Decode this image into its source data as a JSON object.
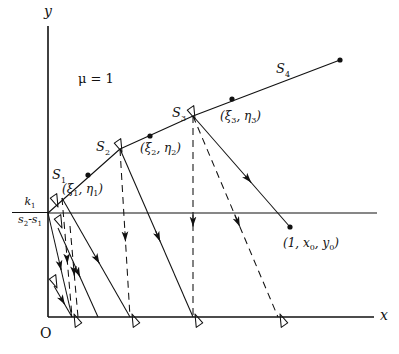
{
  "figure": {
    "background_color": "#ffffff",
    "ink_color": "#111111",
    "width": 399,
    "height": 354
  },
  "axes": {
    "y_label": "y",
    "x_label": "x",
    "origin_label": "O",
    "y_axis": {
      "x": 48,
      "y_top": 26,
      "y_bottom": 317
    },
    "x_axis": {
      "y": 317,
      "x_left": 48,
      "x_right": 374
    },
    "horizontal_line": {
      "y": 213,
      "x_left": 48,
      "x_right": 377
    }
  },
  "annotations": {
    "mu_label": "μ = 1",
    "axis_ratio_numerator": "k",
    "axis_ratio_numerator_sub": "1",
    "axis_ratio_denominator_a": "s",
    "axis_ratio_denominator_a_sub": "2",
    "axis_ratio_denominator_minus": "-",
    "axis_ratio_denominator_b": "s",
    "axis_ratio_denominator_b_sub": "1",
    "endpoint_label": "(1, x₀, y₀)"
  },
  "curve": {
    "name": "upper-characteristic-polyline",
    "points": [
      {
        "x": 48,
        "y": 213
      },
      {
        "x": 120,
        "y": 149
      },
      {
        "x": 193,
        "y": 116
      },
      {
        "x": 340,
        "y": 60
      }
    ]
  },
  "segment_labels": [
    {
      "id": "S1",
      "text": "S",
      "sub": "1",
      "x": 52,
      "y": 168
    },
    {
      "id": "S2",
      "text": "S",
      "sub": "2",
      "x": 96,
      "y": 140
    },
    {
      "id": "S3",
      "text": "S",
      "sub": "3",
      "x": 172,
      "y": 106
    },
    {
      "id": "S4",
      "text": "S",
      "sub": "4",
      "x": 276,
      "y": 62
    }
  ],
  "node_points": [
    {
      "id": "xi1",
      "cx": 88,
      "cy": 175,
      "label": "(ξ",
      "sub1": "1",
      "mid": ", η",
      "sub2": "1",
      "tail": ")",
      "lx": 62,
      "ly": 183
    },
    {
      "id": "xi2",
      "cx": 150,
      "cy": 136,
      "label": "(ξ",
      "sub1": "2",
      "mid": ", η",
      "sub2": "2",
      "tail": ")",
      "lx": 140,
      "ly": 142
    },
    {
      "id": "xi3",
      "cx": 232,
      "cy": 99,
      "label": "(ξ",
      "sub1": "3",
      "mid": ", η",
      "sub2": "3",
      "tail": ")",
      "lx": 220,
      "ly": 110
    },
    {
      "id": "curve-end",
      "cx": 340,
      "cy": 60,
      "label": "",
      "sub1": "",
      "mid": "",
      "sub2": "",
      "tail": "",
      "lx": 0,
      "ly": 0
    },
    {
      "id": "endpoint-1x0y0",
      "cx": 290,
      "cy": 227,
      "label": "(1, x",
      "sub1": "0",
      "mid": ", y",
      "sub2": "0",
      "tail": ")",
      "lx": 283,
      "ly": 237
    }
  ],
  "characteristic_lines": [
    {
      "id": "solid-1",
      "style": "solid",
      "x1": 48,
      "y1": 213,
      "x2": 72,
      "y2": 317,
      "arrow_t": 0.55
    },
    {
      "id": "dashed-1",
      "style": "dashed",
      "x1": 62,
      "y1": 198,
      "x2": 72,
      "y2": 317,
      "arrow_t": 0.55
    },
    {
      "id": "solid-2",
      "style": "solid",
      "x1": 62,
      "y1": 198,
      "x2": 130,
      "y2": 317,
      "arrow_t": 0.55
    },
    {
      "id": "dashed-2",
      "style": "dashed",
      "x1": 120,
      "y1": 149,
      "x2": 130,
      "y2": 317,
      "arrow_t": 0.55
    },
    {
      "id": "solid-3",
      "style": "solid",
      "x1": 120,
      "y1": 149,
      "x2": 193,
      "y2": 317,
      "arrow_t": 0.55
    },
    {
      "id": "dashed-3",
      "style": "dashed",
      "x1": 193,
      "y1": 116,
      "x2": 193,
      "y2": 317,
      "arrow_t": 0.55
    },
    {
      "id": "solid-4",
      "style": "solid",
      "x1": 193,
      "y1": 116,
      "x2": 290,
      "y2": 227,
      "arrow_t": 0.6
    },
    {
      "id": "dashed-4",
      "style": "dashed",
      "x1": 193,
      "y1": 116,
      "x2": 278,
      "y2": 317,
      "arrow_t": 0.55
    }
  ],
  "corner_markers": [
    {
      "id": "marker-s1",
      "x": 58,
      "y": 207,
      "angle": 250
    },
    {
      "id": "marker-s2",
      "x": 122,
      "y": 152,
      "angle": 250
    },
    {
      "id": "marker-s3",
      "x": 195,
      "y": 119,
      "angle": 250
    },
    {
      "id": "marker-foot-1",
      "x": 74,
      "y": 314,
      "angle": 70
    },
    {
      "id": "marker-foot-2",
      "x": 132,
      "y": 314,
      "angle": 70
    },
    {
      "id": "marker-foot-3",
      "x": 195,
      "y": 314,
      "angle": 70
    },
    {
      "id": "marker-foot-4",
      "x": 280,
      "y": 314,
      "angle": 70
    },
    {
      "id": "marker-left-a",
      "x": 62,
      "y": 228,
      "angle": 250
    },
    {
      "id": "marker-left-b",
      "x": 57,
      "y": 288,
      "angle": 250
    }
  ],
  "lower_lines": [
    {
      "id": "lower-solid-a",
      "style": "solid",
      "x1": 58,
      "y1": 228,
      "x2": 98,
      "y2": 317,
      "arrow_t": 0.55
    },
    {
      "id": "lower-dashed-a",
      "style": "dashed",
      "x1": 70,
      "y1": 226,
      "x2": 78,
      "y2": 317,
      "arrow_t": 0.55
    },
    {
      "id": "lower-solid-b",
      "style": "solid",
      "x1": 54,
      "y1": 286,
      "x2": 72,
      "y2": 317,
      "arrow_t": 0.6
    }
  ]
}
